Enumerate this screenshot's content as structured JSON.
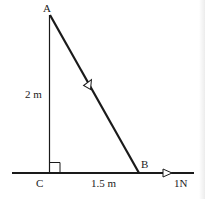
{
  "diagram": {
    "type": "geometry-force-diagram",
    "points": {
      "A": {
        "label": "A"
      },
      "B": {
        "label": "B"
      },
      "C": {
        "label": "C"
      }
    },
    "dimensions": {
      "AC": "2 m",
      "CB": "1.5 m"
    },
    "force": {
      "label": "1N",
      "direction": "horizontal-right"
    },
    "colors": {
      "line": "#1a1a1a",
      "background": "#ffffff"
    },
    "right_angle_at": "C"
  }
}
